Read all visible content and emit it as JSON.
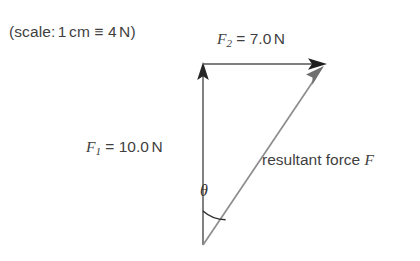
{
  "figure": {
    "scale_note": "(scale: 1 cm ≡ 4 N)",
    "scale_note_parts": {
      "prefix": "(scale:",
      "length": "1",
      "unit": "cm",
      "equiv": "≡",
      "value": "4",
      "force_unit": "N",
      "suffix": ")"
    },
    "background_color": "#ffffff",
    "text_color": "#3f3f3f"
  },
  "vectors": [
    {
      "id": "f1",
      "symbol": "F",
      "subscript": "1",
      "magnitude": "10.0",
      "unit": "N",
      "label": "F1 = 10.0 N",
      "equals": "=",
      "direction": "up",
      "from": [
        203,
        245
      ],
      "to": [
        203,
        64
      ],
      "color": "#6b6b6b",
      "arrow_color": "#262626"
    },
    {
      "id": "f2",
      "symbol": "F",
      "subscript": "2",
      "magnitude": "7.0",
      "unit": "N",
      "label": "F2 = 7.0 N",
      "equals": "=",
      "direction": "right",
      "from": [
        203,
        64
      ],
      "to": [
        325,
        64
      ],
      "color": "#555555",
      "arrow_color": "#1f1f1f"
    },
    {
      "id": "resultant",
      "symbol": "F",
      "subscript": "",
      "magnitude": "",
      "unit": "",
      "label": "resultant force F",
      "label_text": "resultant force",
      "direction": "up-right",
      "from": [
        203,
        245
      ],
      "to": [
        325,
        64
      ],
      "color": "#8d8d8d",
      "arrow_color": "#6f6f6f"
    }
  ],
  "angle": {
    "id": "theta",
    "symbol": "θ",
    "vertex": [
      203,
      245
    ],
    "arc_radius": 34,
    "between": [
      "f1",
      "resultant"
    ],
    "color": "#2e2e2e"
  }
}
